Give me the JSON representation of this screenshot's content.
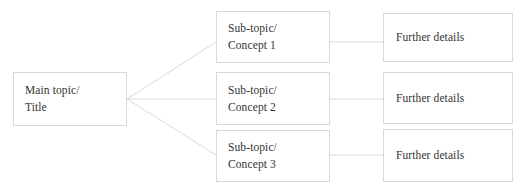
{
  "diagram": {
    "type": "tree-mind-map",
    "title_text": "Main topic/\nTitle",
    "background_color": "#ffffff",
    "border_color": "#d9d9d9",
    "text_color": "#333333",
    "root": {
      "name": "main-topic",
      "line1": "Main topic/",
      "line2": "Title"
    },
    "branches": [
      {
        "name": "sub-topic-1",
        "line1": "Sub-topic/",
        "line2": "Concept 1",
        "detail": "Further details"
      },
      {
        "name": "sub-topic-2",
        "line1": "Sub-topic/",
        "line2": "Concept 2",
        "detail": "Further details"
      },
      {
        "name": "sub-topic-3",
        "line1": "Sub-topic/",
        "line2": "Concept 3",
        "detail": "Further details"
      }
    ],
    "connectors": [
      {
        "name": "root-to-sub-1",
        "from": [
          127,
          99
        ],
        "to": [
          216,
          42
        ]
      },
      {
        "name": "root-to-sub-2",
        "from": [
          127,
          99
        ],
        "to": [
          216,
          99
        ]
      },
      {
        "name": "root-to-sub-3",
        "from": [
          127,
          99
        ],
        "to": [
          216,
          155
        ]
      },
      {
        "name": "sub-1-to-detail-1",
        "from": [
          330,
          42
        ],
        "to": [
          383,
          42
        ]
      },
      {
        "name": "sub-2-to-detail-2",
        "from": [
          330,
          99
        ],
        "to": [
          383,
          99
        ]
      },
      {
        "name": "sub-3-to-detail-3",
        "from": [
          330,
          155
        ],
        "to": [
          383,
          155
        ]
      }
    ]
  }
}
